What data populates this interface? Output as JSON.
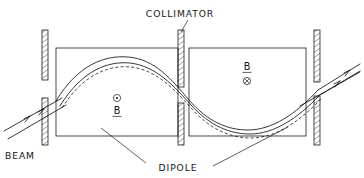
{
  "figure": {
    "background_color": "#ffffff",
    "line_color": "#1a1a1a",
    "width": 364,
    "height": 178
  },
  "labels": {
    "collimator": "COLLIMATOR",
    "dipole": "DIPOLE",
    "beam": "BEAM",
    "field_left_symbol": "B",
    "field_left_direction_icon": "circle-dot-out-of-page",
    "field_right_symbol": "B",
    "field_right_direction_icon": "circle-cross-into-page"
  },
  "elements": {
    "dipole_left": {
      "name": "left dipole magnet",
      "x": 56,
      "y": 48,
      "width": 122,
      "height": 88
    },
    "dipole_right": {
      "name": "right dipole magnet",
      "x": 189,
      "y": 48,
      "width": 117,
      "height": 88
    },
    "collimator_entrance_upper": {
      "x": 42,
      "y": 30,
      "width": 6,
      "height": 50
    },
    "collimator_entrance_lower": {
      "x": 42,
      "y": 98,
      "width": 6,
      "height": 47
    },
    "collimator_middle_upper": {
      "x": 178,
      "y": 30,
      "width": 6,
      "height": 57
    },
    "collimator_middle_lower": {
      "x": 178,
      "y": 103,
      "width": 6,
      "height": 42
    },
    "collimator_exit_upper": {
      "x": 314,
      "y": 30,
      "width": 6,
      "height": 52
    },
    "collimator_exit_lower": {
      "x": 314,
      "y": 96,
      "width": 6,
      "height": 49
    }
  },
  "trajectories": [
    {
      "name": "central-trajectory",
      "style": "solid"
    },
    {
      "name": "offset-trajectory",
      "style": "dashed"
    }
  ]
}
